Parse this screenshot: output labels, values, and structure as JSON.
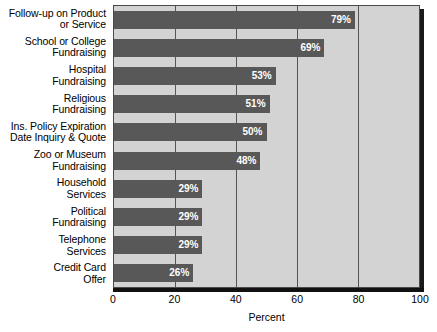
{
  "chart_data": {
    "type": "bar",
    "orientation": "horizontal",
    "title": "",
    "subtitle": "",
    "xlabel": "Percent",
    "ylabel": "",
    "xlim": [
      0,
      100
    ],
    "xticks": [
      0,
      20,
      40,
      60,
      80,
      100
    ],
    "xticklabels": [
      "0",
      "20",
      "40",
      "60",
      "80",
      "100"
    ],
    "grid": true,
    "gridlines_at": [
      20,
      40,
      60,
      80
    ],
    "legend": false,
    "value_suffix": "%",
    "bar_color": "#585858",
    "plot_background": "#d3d3d3",
    "label_color": "#ffffff",
    "categories": [
      "Follow-up on Product or Service",
      "School or College Fundraising",
      "Hospital Fundraising",
      "Religious Fundraising",
      "Ins. Policy Expiration Date Inquiry & Quote",
      "Zoo or Museum Fundraising",
      "Household Services",
      "Political Fundraising",
      "Telephone Services",
      "Credit Card Offer"
    ],
    "category_lines": [
      [
        "Follow-up on Product",
        "or Service"
      ],
      [
        "School or College",
        "Fundraising"
      ],
      [
        "Hospital",
        "Fundraising"
      ],
      [
        "Religious",
        "Fundraising"
      ],
      [
        "Ins. Policy Expiration",
        "Date Inquiry & Quote"
      ],
      [
        "Zoo or Museum",
        "Fundraising"
      ],
      [
        "Household",
        "Services"
      ],
      [
        "Political",
        "Fundraising"
      ],
      [
        "Telephone",
        "Services"
      ],
      [
        "Credit Card",
        "Offer"
      ]
    ],
    "values": [
      79,
      69,
      53,
      51,
      50,
      48,
      29,
      29,
      29,
      26
    ],
    "data_labels": [
      "79%",
      "69%",
      "53%",
      "51%",
      "50%",
      "48%",
      "29%",
      "29%",
      "29%",
      "26%"
    ]
  }
}
